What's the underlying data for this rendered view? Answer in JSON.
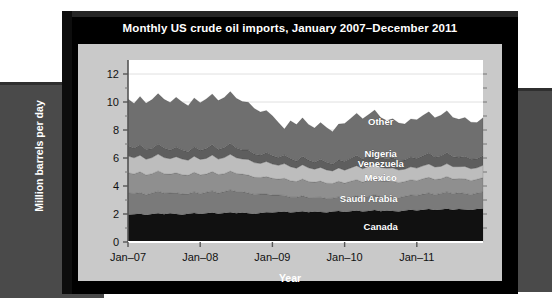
{
  "chart_data": {
    "type": "area",
    "stacked": true,
    "title": "Monthly US crude oil imports, January 2007–December 2011",
    "xlabel": "Year",
    "ylabel": "Million barrels per day",
    "ylim": [
      0,
      13
    ],
    "yticks": [
      0,
      2,
      4,
      6,
      8,
      10,
      12
    ],
    "xtick_labels": [
      "Jan–07",
      "Jan–08",
      "Jan–09",
      "Jan–10",
      "Jan–11"
    ],
    "xtick_indices": [
      0,
      12,
      24,
      36,
      48
    ],
    "n_points": 60,
    "grid": true,
    "legend_position": "inline-labels",
    "colors": {
      "canada": "#111111",
      "saudi_arabia": "#7a7a7a",
      "mexico": "#8f8f8f",
      "venezuela": "#bdbdbd",
      "nigeria": "#5e5e5e",
      "other": "#6f6f6f",
      "plot_background": "#ffffff",
      "panel": "#c9c9c9",
      "frame": "#000000",
      "page_band": "#4a4a4a"
    },
    "series": [
      {
        "name": "Canada",
        "values": [
          1.95,
          1.98,
          2.02,
          1.92,
          2.0,
          2.05,
          1.98,
          2.05,
          2.0,
          1.95,
          2.02,
          2.08,
          2.0,
          2.05,
          2.1,
          2.02,
          2.08,
          2.12,
          2.05,
          2.1,
          2.05,
          2.0,
          2.08,
          2.12,
          2.1,
          2.15,
          2.18,
          2.1,
          2.15,
          2.2,
          2.12,
          2.18,
          2.15,
          2.1,
          2.18,
          2.22,
          2.15,
          2.2,
          2.25,
          2.18,
          2.22,
          2.28,
          2.2,
          2.25,
          2.22,
          2.18,
          2.25,
          2.3,
          2.25,
          2.3,
          2.35,
          2.28,
          2.32,
          2.38,
          2.3,
          2.35,
          2.32,
          2.28,
          2.35,
          2.4
        ]
      },
      {
        "name": "Saudi Arabia",
        "values": [
          1.55,
          1.48,
          1.52,
          1.45,
          1.5,
          1.58,
          1.5,
          1.45,
          1.52,
          1.48,
          1.42,
          1.5,
          1.45,
          1.5,
          1.55,
          1.48,
          1.52,
          1.6,
          1.55,
          1.5,
          1.45,
          1.4,
          1.35,
          1.3,
          1.25,
          1.2,
          1.15,
          1.1,
          1.05,
          1.1,
          1.05,
          1.0,
          1.05,
          1.0,
          0.95,
          1.0,
          0.98,
          1.02,
          1.05,
          1.0,
          1.05,
          1.1,
          1.05,
          1.02,
          1.0,
          0.98,
          1.02,
          1.05,
          1.08,
          1.12,
          1.15,
          1.1,
          1.15,
          1.2,
          1.15,
          1.18,
          1.15,
          1.1,
          1.15,
          1.18
        ]
      },
      {
        "name": "Mexico",
        "values": [
          1.45,
          1.4,
          1.48,
          1.42,
          1.38,
          1.45,
          1.4,
          1.35,
          1.42,
          1.38,
          1.32,
          1.4,
          1.35,
          1.3,
          1.38,
          1.32,
          1.28,
          1.35,
          1.3,
          1.25,
          1.28,
          1.22,
          1.18,
          1.25,
          1.2,
          1.15,
          1.22,
          1.18,
          1.12,
          1.2,
          1.15,
          1.1,
          1.15,
          1.1,
          1.05,
          1.12,
          1.08,
          1.12,
          1.15,
          1.1,
          1.15,
          1.18,
          1.12,
          1.08,
          1.12,
          1.08,
          1.05,
          1.1,
          1.05,
          1.1,
          1.12,
          1.08,
          1.05,
          1.1,
          1.05,
          1.0,
          1.05,
          1.0,
          0.98,
          1.02
        ]
      },
      {
        "name": "Venezuela",
        "values": [
          1.2,
          1.15,
          1.18,
          1.12,
          1.15,
          1.2,
          1.15,
          1.1,
          1.15,
          1.12,
          1.08,
          1.15,
          1.1,
          1.12,
          1.18,
          1.1,
          1.15,
          1.2,
          1.12,
          1.08,
          1.12,
          1.05,
          1.0,
          1.08,
          1.02,
          0.98,
          1.05,
          1.0,
          0.95,
          1.02,
          0.98,
          0.92,
          0.98,
          0.95,
          0.9,
          0.95,
          0.92,
          0.95,
          1.0,
          0.95,
          0.98,
          1.02,
          0.95,
          0.92,
          0.95,
          0.9,
          0.88,
          0.92,
          0.9,
          0.92,
          0.95,
          0.9,
          0.88,
          0.92,
          0.88,
          0.85,
          0.88,
          0.85,
          0.82,
          0.88
        ]
      },
      {
        "name": "Nigeria",
        "values": [
          0.72,
          0.68,
          0.75,
          0.7,
          0.65,
          0.72,
          0.68,
          0.62,
          0.7,
          0.65,
          0.6,
          0.68,
          0.65,
          0.7,
          0.75,
          0.68,
          0.72,
          0.78,
          0.7,
          0.65,
          0.68,
          0.62,
          0.58,
          0.65,
          0.6,
          0.55,
          0.62,
          0.58,
          0.52,
          0.6,
          0.55,
          0.5,
          0.58,
          0.55,
          0.5,
          0.58,
          0.62,
          0.68,
          0.75,
          0.7,
          0.75,
          0.8,
          0.72,
          0.68,
          0.72,
          0.68,
          0.65,
          0.7,
          0.68,
          0.72,
          0.78,
          0.7,
          0.75,
          0.8,
          0.72,
          0.68,
          0.72,
          0.68,
          0.65,
          0.7
        ]
      },
      {
        "name": "Other",
        "values": [
          3.35,
          3.2,
          3.45,
          3.3,
          3.5,
          3.6,
          3.48,
          3.4,
          3.55,
          3.42,
          3.3,
          3.48,
          3.4,
          3.55,
          3.62,
          3.5,
          3.58,
          3.7,
          3.55,
          3.45,
          3.4,
          3.25,
          3.1,
          3.0,
          2.85,
          2.5,
          1.85,
          2.7,
          2.6,
          2.75,
          2.55,
          2.45,
          2.62,
          2.48,
          2.3,
          2.55,
          2.72,
          2.85,
          3.0,
          2.88,
          2.95,
          3.05,
          2.85,
          2.72,
          2.8,
          2.68,
          2.58,
          2.72,
          2.78,
          2.88,
          2.95,
          2.82,
          2.9,
          2.98,
          2.8,
          2.7,
          2.78,
          2.65,
          2.58,
          2.7
        ]
      }
    ],
    "series_label_positions": [
      {
        "name": "Other",
        "x_index": 42,
        "y_value": 8.6
      },
      {
        "name": "Nigeria",
        "x_index": 42,
        "y_value": 6.3
      },
      {
        "name": "Venezuela",
        "x_index": 42,
        "y_value": 5.55
      },
      {
        "name": "Mexico",
        "x_index": 42,
        "y_value": 4.55
      },
      {
        "name": "Saudi Arabia",
        "x_index": 40,
        "y_value": 3.1
      },
      {
        "name": "Canada",
        "x_index": 42,
        "y_value": 1.1
      }
    ]
  },
  "caption": ""
}
